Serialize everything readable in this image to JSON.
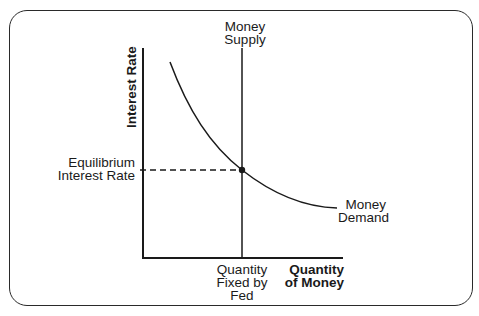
{
  "diagram": {
    "type": "supply-demand diagram",
    "y_axis_label": "Interest Rate",
    "x_axis_label_line1": "Quantity",
    "x_axis_label_line2": "of Money",
    "supply_curve": {
      "label_line1": "Money",
      "label_line2": "Supply",
      "shape": "vertical line"
    },
    "demand_curve": {
      "label_line1": "Money",
      "label_line2": "Demand",
      "shape": "downward-sloping convex curve"
    },
    "equilibrium_rate_label_line1": "Equilibrium",
    "equilibrium_rate_label_line2": "Interest Rate",
    "fixed_quantity_label_line1": "Quantity",
    "fixed_quantity_label_line2": "Fixed by",
    "fixed_quantity_label_line3": "Fed",
    "colors": {
      "line": "#1a1a1a",
      "background": "#ffffff"
    }
  }
}
